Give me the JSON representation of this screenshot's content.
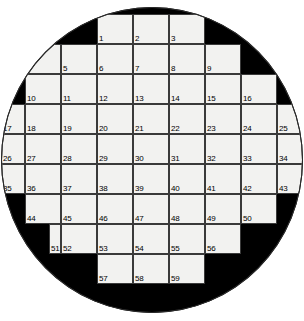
{
  "puzzle": {
    "title": "Circular Crossword Grid",
    "shape": "circle",
    "fill_color": "#f2f2f0",
    "block_color": "#000000",
    "line_color": "#3a3a3a",
    "page_background": "#ffffff",
    "number_count": 59,
    "geometry": {
      "canvas_width": 304,
      "canvas_height": 321,
      "circle_left": 1,
      "circle_top": 7,
      "circle_width": 302,
      "circle_height": 306,
      "cell_width": 32,
      "cell_height": 30,
      "col_x": [
        12,
        44,
        76,
        108,
        140,
        172,
        204,
        236,
        268
      ],
      "row_y": [
        13,
        43,
        73,
        103,
        133,
        163,
        193,
        223,
        253,
        283
      ]
    },
    "rows": [
      {
        "index": 0,
        "label": "row-1",
        "y": 13,
        "cells": [
          {
            "num": "1",
            "x": 96,
            "w": 36
          },
          {
            "num": "2",
            "x": 132,
            "w": 36
          },
          {
            "num": "3",
            "x": 168,
            "w": 36
          }
        ]
      },
      {
        "index": 1,
        "label": "row-2",
        "y": 43,
        "cells": [
          {
            "num": "4",
            "x": 24,
            "w": 36
          },
          {
            "num": "5",
            "x": 60,
            "w": 36
          },
          {
            "num": "6",
            "x": 96,
            "w": 36
          },
          {
            "num": "7",
            "x": 132,
            "w": 36
          },
          {
            "num": "8",
            "x": 168,
            "w": 36
          },
          {
            "num": "9",
            "x": 204,
            "w": 36
          }
        ]
      },
      {
        "index": 2,
        "label": "row-3",
        "y": 73,
        "cells": [
          {
            "num": "10",
            "x": 24,
            "w": 36
          },
          {
            "num": "11",
            "x": 60,
            "w": 36
          },
          {
            "num": "12",
            "x": 96,
            "w": 36
          },
          {
            "num": "13",
            "x": 132,
            "w": 36
          },
          {
            "num": "14",
            "x": 168,
            "w": 36
          },
          {
            "num": "15",
            "x": 204,
            "w": 36
          },
          {
            "num": "16",
            "x": 240,
            "w": 36
          }
        ]
      },
      {
        "index": 3,
        "label": "row-4",
        "y": 103,
        "cells": [
          {
            "num": "17",
            "x": 0,
            "w": 24
          },
          {
            "num": "18",
            "x": 24,
            "w": 36
          },
          {
            "num": "19",
            "x": 60,
            "w": 36
          },
          {
            "num": "20",
            "x": 96,
            "w": 36
          },
          {
            "num": "21",
            "x": 132,
            "w": 36
          },
          {
            "num": "22",
            "x": 168,
            "w": 36
          },
          {
            "num": "23",
            "x": 204,
            "w": 36
          },
          {
            "num": "24",
            "x": 240,
            "w": 36
          },
          {
            "num": "25",
            "x": 276,
            "w": 28
          }
        ]
      },
      {
        "index": 4,
        "label": "row-5",
        "y": 133,
        "cells": [
          {
            "num": "26",
            "x": 0,
            "w": 24
          },
          {
            "num": "27",
            "x": 24,
            "w": 36
          },
          {
            "num": "28",
            "x": 60,
            "w": 36
          },
          {
            "num": "29",
            "x": 96,
            "w": 36
          },
          {
            "num": "30",
            "x": 132,
            "w": 36
          },
          {
            "num": "31",
            "x": 168,
            "w": 36
          },
          {
            "num": "32",
            "x": 204,
            "w": 36
          },
          {
            "num": "33",
            "x": 240,
            "w": 36
          },
          {
            "num": "34",
            "x": 276,
            "w": 28
          }
        ]
      },
      {
        "index": 5,
        "label": "row-6",
        "y": 163,
        "cells": [
          {
            "num": "35",
            "x": 0,
            "w": 24
          },
          {
            "num": "36",
            "x": 24,
            "w": 36
          },
          {
            "num": "37",
            "x": 60,
            "w": 36
          },
          {
            "num": "38",
            "x": 96,
            "w": 36
          },
          {
            "num": "39",
            "x": 132,
            "w": 36
          },
          {
            "num": "40",
            "x": 168,
            "w": 36
          },
          {
            "num": "41",
            "x": 204,
            "w": 36
          },
          {
            "num": "42",
            "x": 240,
            "w": 36
          },
          {
            "num": "43",
            "x": 276,
            "w": 28
          }
        ]
      },
      {
        "index": 6,
        "label": "row-7",
        "y": 193,
        "cells": [
          {
            "num": "44",
            "x": 24,
            "w": 36
          },
          {
            "num": "45",
            "x": 60,
            "w": 36
          },
          {
            "num": "46",
            "x": 96,
            "w": 36
          },
          {
            "num": "47",
            "x": 132,
            "w": 36
          },
          {
            "num": "48",
            "x": 168,
            "w": 36
          },
          {
            "num": "49",
            "x": 204,
            "w": 36
          },
          {
            "num": "50",
            "x": 240,
            "w": 36
          }
        ]
      },
      {
        "index": 7,
        "label": "row-8",
        "y": 223,
        "cells": [
          {
            "num": "51",
            "x": 48,
            "w": 12
          },
          {
            "num": "52",
            "x": 60,
            "w": 36
          },
          {
            "num": "53",
            "x": 96,
            "w": 36
          },
          {
            "num": "54",
            "x": 132,
            "w": 36
          },
          {
            "num": "55",
            "x": 168,
            "w": 36
          },
          {
            "num": "56",
            "x": 204,
            "w": 36
          }
        ]
      },
      {
        "index": 8,
        "label": "row-9",
        "y": 253,
        "cells": [
          {
            "num": "57",
            "x": 96,
            "w": 36
          },
          {
            "num": "58",
            "x": 132,
            "w": 36
          },
          {
            "num": "59",
            "x": 168,
            "w": 36
          }
        ]
      }
    ]
  }
}
